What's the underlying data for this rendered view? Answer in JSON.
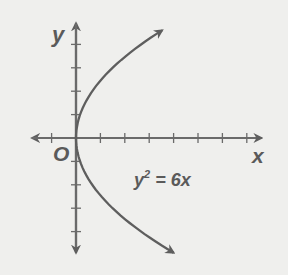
{
  "chart_data": {
    "type": "line",
    "title": "",
    "equation": {
      "lhs_base": "y",
      "lhs_exp": "2",
      "rhs": " = 6x"
    },
    "xlabel": "x",
    "ylabel": "y",
    "origin_label": "O",
    "xlim": [
      -1.8,
      7.6
    ],
    "ylim": [
      -4.9,
      4.9
    ],
    "x_ticks": [
      -1,
      1,
      2,
      3,
      4,
      5,
      6,
      7
    ],
    "y_ticks": [
      -4,
      -3,
      -2,
      -1,
      1,
      2,
      3,
      4
    ],
    "grid": false,
    "series": [
      {
        "name": "y^2 = 6x",
        "x": [
          4.1,
          2.67,
          1.5,
          0.67,
          0.17,
          0,
          0.17,
          0.67,
          1.5,
          2.67,
          4.0
        ],
        "y": [
          4.6,
          4,
          3,
          2,
          1,
          0,
          -1,
          -2,
          -3,
          -4,
          -4.9
        ],
        "arrows": "both ends"
      }
    ],
    "colors": {
      "axis": "#6a6a6a",
      "curve": "#5e5e5e",
      "background": "#efefed"
    }
  }
}
